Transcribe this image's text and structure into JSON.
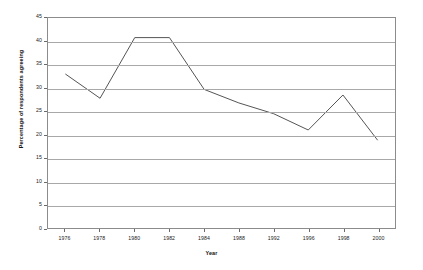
{
  "chart_data": {
    "type": "line",
    "title": "",
    "xlabel": "Year",
    "ylabel": "Percentage of respondents agreeing",
    "categories": [
      "1976",
      "1978",
      "1980",
      "1982",
      "1984",
      "1988",
      "1992",
      "1996",
      "1998",
      "2000"
    ],
    "values": [
      33.0,
      27.8,
      40.8,
      40.8,
      29.7,
      26.8,
      24.5,
      21.0,
      28.5,
      18.8
    ],
    "series": [
      {
        "name": "Percentage of respondents agreeing",
        "values": [
          33.0,
          27.8,
          40.8,
          40.8,
          29.7,
          26.8,
          24.5,
          21.0,
          28.5,
          18.8
        ]
      }
    ],
    "ylim": [
      0,
      45
    ],
    "yticks": [
      0,
      5,
      10,
      15,
      20,
      25,
      30,
      35,
      40,
      45
    ],
    "ytick_labels": [
      "0",
      "5",
      "10",
      "15",
      "20",
      "25",
      "30",
      "35",
      "40",
      "45"
    ],
    "grid": true,
    "grid_axis": "y",
    "legend": false,
    "legend_position": "none",
    "line_color": "#555555",
    "grid_color": "#a8a8a8",
    "frame_color": "#8c8c8c",
    "background_color": "#ffffff"
  }
}
